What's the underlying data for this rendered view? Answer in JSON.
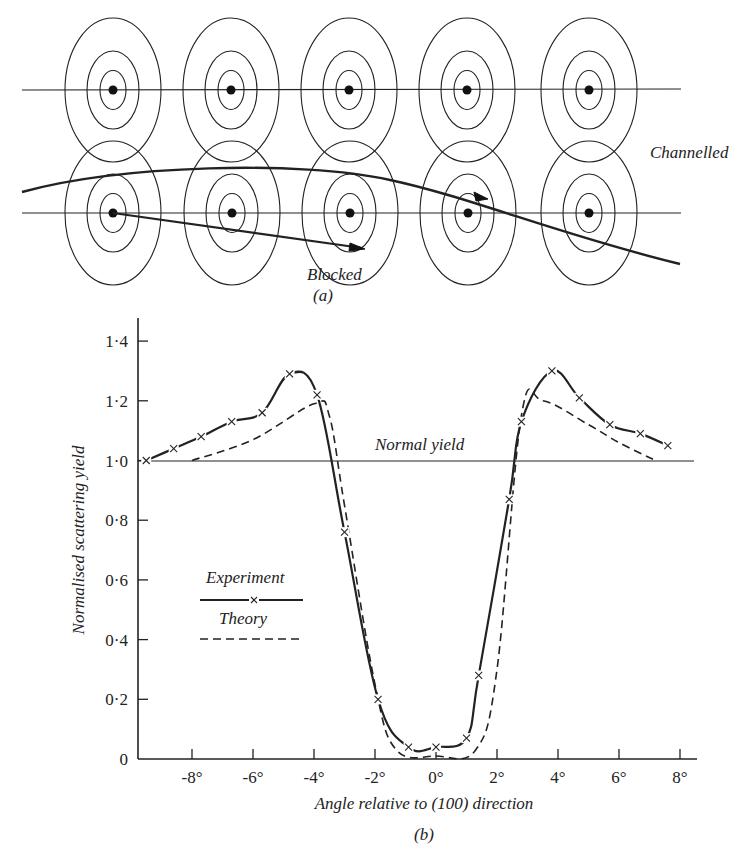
{
  "panel_a": {
    "caption": "(a)",
    "labels": {
      "channelled": "Channelled",
      "blocked": "Blocked"
    },
    "rows": [
      {
        "y": 90,
        "atoms_x": [
          113,
          231,
          349,
          467,
          589
        ]
      },
      {
        "y": 213,
        "atoms_x": [
          113,
          232,
          350,
          468,
          589
        ]
      }
    ],
    "ring_radii": [
      48,
      26,
      13
    ],
    "trajectories": {
      "channelled": "M 22 192 C 120 165, 300 160, 390 180 C 470 197, 560 235, 680 264",
      "blocked": "M 113 213 L 362 248"
    }
  },
  "panel_b": {
    "caption": "(b)",
    "normal_yield_label": "Normal yield",
    "legend": {
      "experiment": "Experiment",
      "theory": "Theory"
    }
  },
  "chart_data": {
    "type": "line",
    "title": "",
    "xlabel": "Angle relative to (100) direction",
    "ylabel": "Normalised scattering yield",
    "xlim": [
      -10,
      9
    ],
    "ylim": [
      0,
      1.45
    ],
    "x_ticks": [
      "-8°",
      "-6°",
      "-4°",
      "-2°",
      "0°",
      "2°",
      "4°",
      "6°",
      "8°"
    ],
    "x_tick_values": [
      -8,
      -6,
      -4,
      -2,
      0,
      2,
      4,
      6,
      8
    ],
    "y_ticks": [
      "0",
      "0·2",
      "0·4",
      "0·6",
      "0·8",
      "1·0",
      "1·2",
      "1·4"
    ],
    "y_tick_values": [
      0,
      0.2,
      0.4,
      0.6,
      0.8,
      1.0,
      1.2,
      1.4
    ],
    "reference_line": {
      "label": "Normal yield",
      "y": 1.0
    },
    "grid": false,
    "legend_position": "inside-left",
    "series": [
      {
        "name": "Experiment",
        "style": "solid line with x markers",
        "points": [
          [
            -9.5,
            1.0
          ],
          [
            -8.6,
            1.04
          ],
          [
            -7.7,
            1.08
          ],
          [
            -6.7,
            1.13
          ],
          [
            -5.7,
            1.16
          ],
          [
            -4.8,
            1.29
          ],
          [
            -3.9,
            1.22
          ],
          [
            -3.0,
            0.76
          ],
          [
            -1.9,
            0.2
          ],
          [
            -0.9,
            0.04
          ],
          [
            0.0,
            0.04
          ],
          [
            1.0,
            0.07
          ],
          [
            1.4,
            0.28
          ],
          [
            2.4,
            0.87
          ],
          [
            2.8,
            1.13
          ],
          [
            3.8,
            1.3
          ],
          [
            4.7,
            1.21
          ],
          [
            5.7,
            1.12
          ],
          [
            6.7,
            1.09
          ],
          [
            7.6,
            1.05
          ]
        ]
      },
      {
        "name": "Theory",
        "style": "dashed line",
        "points": [
          [
            -8.0,
            1.0
          ],
          [
            -6.0,
            1.07
          ],
          [
            -4.0,
            1.19
          ],
          [
            -3.5,
            1.15
          ],
          [
            -3.0,
            0.85
          ],
          [
            -2.0,
            0.25
          ],
          [
            -1.3,
            0.03
          ],
          [
            0.0,
            0.01
          ],
          [
            1.3,
            0.03
          ],
          [
            2.0,
            0.3
          ],
          [
            2.8,
            1.15
          ],
          [
            3.5,
            1.2
          ],
          [
            5.0,
            1.12
          ],
          [
            6.0,
            1.06
          ],
          [
            7.2,
            1.0
          ]
        ]
      }
    ]
  }
}
